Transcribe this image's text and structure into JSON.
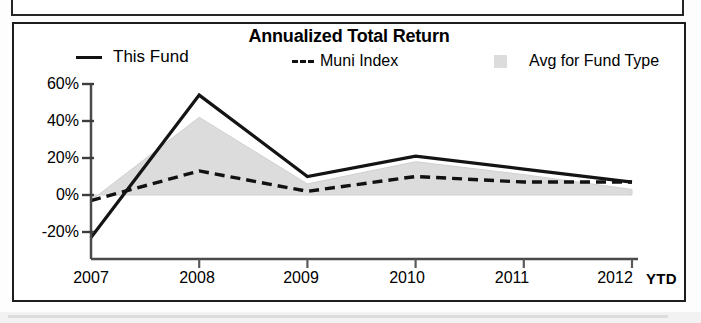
{
  "document": {
    "upper_panel_fragment_name": "clipped-panel-above"
  },
  "chart": {
    "title": "Annualized Total Return",
    "legend": [
      {
        "label": "This Fund",
        "marker": "solid-line",
        "color": "#111111"
      },
      {
        "label": "Muni Index",
        "marker": "dashed-line",
        "color": "#111111"
      },
      {
        "label": "Avg for Fund Type",
        "marker": "filled-area",
        "color": "#dcdcdc"
      }
    ],
    "axis": {
      "y_ticks": [
        "60%",
        "40%",
        "20%",
        "0%",
        "-20%"
      ],
      "x_ticks": [
        "2007",
        "2008",
        "2009",
        "2010",
        "2011",
        "2012"
      ],
      "x_suffix": "YTD"
    }
  },
  "chart_data": {
    "type": "line",
    "title": "Annualized Total Return",
    "xlabel": "",
    "ylabel": "",
    "x": [
      "2007",
      "2008",
      "2009",
      "2010",
      "2011",
      "2012 YTD"
    ],
    "categories": [
      "2007",
      "2008",
      "2009",
      "2010",
      "2011",
      "2012 YTD"
    ],
    "ylim": [
      -30,
      60
    ],
    "yticks": [
      -20,
      0,
      20,
      40,
      60
    ],
    "ytick_labels": [
      "-20%",
      "0%",
      "20%",
      "40%",
      "60%"
    ],
    "grid": false,
    "legend_position": "top",
    "units": "percent",
    "series": [
      {
        "name": "This Fund",
        "style": "solid",
        "color": "#111111",
        "values": [
          -23,
          54,
          10,
          21,
          14,
          7
        ]
      },
      {
        "name": "Muni Index",
        "style": "dashed",
        "color": "#111111",
        "values": [
          -3,
          13,
          2,
          10,
          7,
          7
        ]
      },
      {
        "name": "Avg for Fund Type",
        "style": "area",
        "color": "#dcdcdc",
        "values": [
          -3,
          42,
          6,
          18,
          11,
          3
        ]
      }
    ]
  }
}
